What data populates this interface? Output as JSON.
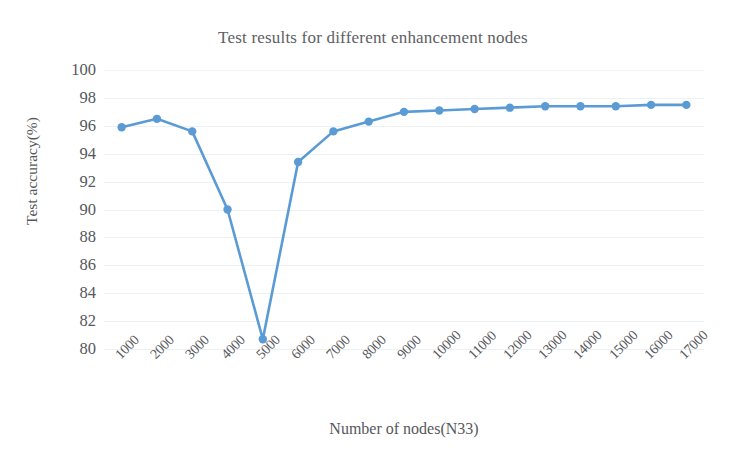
{
  "chart_data": {
    "type": "line",
    "title": "Test results for different enhancement nodes",
    "xlabel": "Number of nodes(N33)",
    "ylabel": "Test accuracy(%)",
    "categories": [
      "1000",
      "2000",
      "3000",
      "4000",
      "5000",
      "6000",
      "7000",
      "8000",
      "9000",
      "10000",
      "11000",
      "12000",
      "13000",
      "14000",
      "15000",
      "16000",
      "17000"
    ],
    "values": [
      95.9,
      96.5,
      95.6,
      90.0,
      80.7,
      93.4,
      95.6,
      96.3,
      97.0,
      97.1,
      97.2,
      97.3,
      97.4,
      97.4,
      97.4,
      97.5,
      97.5
    ],
    "series": [
      {
        "name": "Test accuracy",
        "values": [
          95.9,
          96.5,
          95.6,
          90.0,
          80.7,
          93.4,
          95.6,
          96.3,
          97.0,
          97.1,
          97.2,
          97.3,
          97.4,
          97.4,
          97.4,
          97.5,
          97.5
        ]
      }
    ],
    "ylim": [
      80,
      100
    ],
    "ytick_labels": [
      "100",
      "98",
      "96",
      "94",
      "92",
      "90",
      "88",
      "86",
      "84",
      "82",
      "80"
    ],
    "ytick_values": [
      100,
      98,
      96,
      94,
      92,
      90,
      88,
      86,
      84,
      82,
      80
    ],
    "grid": true,
    "grid_axis": "y",
    "legend": false,
    "legend_position": "none",
    "line_color": "#5b9bd5",
    "marker_color": "#5b9bd5",
    "marker": "circle",
    "xtick_rotation": -45
  }
}
